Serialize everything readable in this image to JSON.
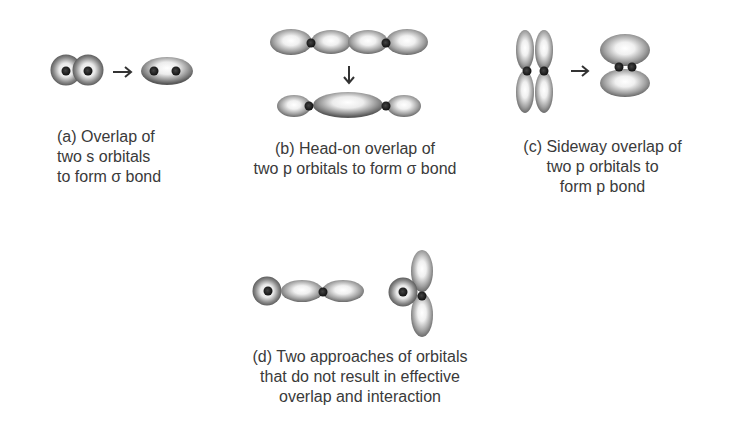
{
  "figure": {
    "panels": {
      "a": {
        "label": "(a)",
        "caption_lines": [
          "(a) Overlap of",
          "two s orbitals",
          "to form σ bond"
        ],
        "before": "two s orbitals overlapping",
        "after": "σ bond (merged s orbitals)"
      },
      "b": {
        "label": "(b)",
        "caption_lines": [
          "(b) Head-on overlap of",
          "two p orbitals to form σ bond"
        ],
        "before": "two p orbitals end-to-end",
        "after": "σ bond along axis"
      },
      "c": {
        "label": "(c)",
        "caption_lines": [
          "(c) Sideway overlap of",
          "two p orbitals to",
          "form p bond"
        ],
        "before": "two parallel p orbitals",
        "after": "p bond (side lobes)"
      },
      "d": {
        "label": "(d)",
        "caption_lines": [
          "(d) Two approaches of orbitals",
          "that do not result in effective",
          "overlap and interaction"
        ],
        "approach_1": "s orbital approaching p orbital node",
        "approach_2": "s orbital beside perpendicular p orbital"
      }
    },
    "arrows": {
      "a": "→",
      "b": "↓",
      "c": "→"
    },
    "colors": {
      "background": "#ffffff",
      "text": "#3a3a3a",
      "orbital_dark": "#6a6a6a",
      "orbital_light": "#f4f4f4",
      "nucleus": "#222222"
    }
  }
}
